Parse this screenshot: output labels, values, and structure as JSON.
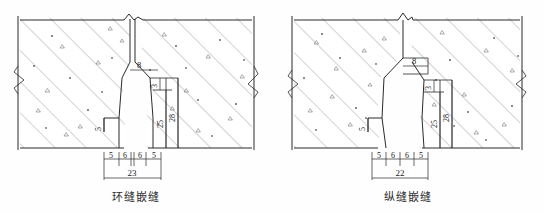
{
  "figure": {
    "title_left": "环缝嵌缝",
    "title_right": "纵缝嵌缝"
  },
  "left_detail": {
    "caption": "环缝嵌缝",
    "slot_width": "8",
    "notch_depth": "5",
    "upper_dim": "3",
    "inner_depth": "25",
    "outer_depth": "28",
    "chain": [
      "5",
      "6",
      "6",
      "5"
    ],
    "total": "23"
  },
  "right_detail": {
    "caption": "纵缝嵌缝",
    "slot_width": "8",
    "notch_depth": "5",
    "upper_dim": "3",
    "inner_depth": "25",
    "outer_depth": "28",
    "chain": [
      "5",
      "6",
      "6",
      "5"
    ],
    "total": "22"
  },
  "colors": {
    "line": "#2a2a2a",
    "hatch": "#5a5a5a",
    "paper": "#fefefe"
  }
}
